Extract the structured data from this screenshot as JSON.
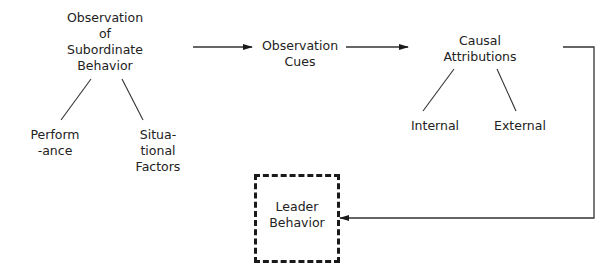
{
  "diagram": {
    "nodes": {
      "observation": {
        "lines": [
          "Observation",
          "of",
          "Subordinate",
          "Behavior"
        ]
      },
      "performance": {
        "lines": [
          "Perform",
          "-ance"
        ]
      },
      "situational": {
        "lines": [
          "Situa-",
          "tional",
          "Factors"
        ]
      },
      "cues": {
        "lines": [
          "Observation",
          "Cues"
        ]
      },
      "causal": {
        "lines": [
          "Causal",
          "Attributions"
        ]
      },
      "internal": {
        "label": "Internal"
      },
      "external": {
        "label": "External"
      },
      "leader": {
        "lines": [
          "Leader",
          "Behavior"
        ],
        "border": "dashed"
      }
    },
    "edges": [
      {
        "from": "observation",
        "to": "cues",
        "type": "arrow"
      },
      {
        "from": "cues",
        "to": "causal",
        "type": "arrow"
      },
      {
        "from": "causal",
        "to": "leader",
        "type": "elbow-arrow"
      },
      {
        "from": "observation",
        "to": "performance",
        "type": "line"
      },
      {
        "from": "observation",
        "to": "situational",
        "type": "line"
      },
      {
        "from": "causal",
        "to": "internal",
        "type": "line"
      },
      {
        "from": "causal",
        "to": "external",
        "type": "line"
      }
    ],
    "colors": {
      "line": "#333333",
      "text": "#222222",
      "background": "#ffffff"
    }
  }
}
